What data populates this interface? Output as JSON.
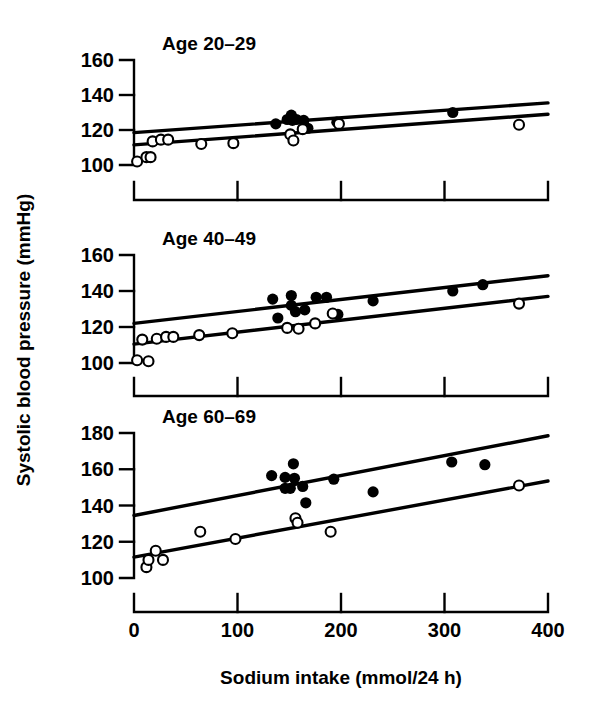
{
  "figure": {
    "xlabel": "Sodium intake (mmol/24 h)",
    "ylabel": "Systolic blood pressure (mmHg)",
    "ink_color": "#000000",
    "background_color": "#ffffff"
  },
  "chart_data": {
    "type": "scatter",
    "title": "",
    "xlabel": "Sodium intake (mmol/24 h)",
    "ylabel": "Systolic blood pressure (mmHg)",
    "xlim": [
      0,
      400
    ],
    "xticks": [
      0,
      100,
      200,
      300,
      400
    ],
    "xticklabels": [
      "0",
      "100",
      "200",
      "300",
      "400"
    ],
    "grid": false,
    "legend_position": "none",
    "series_marker_key": {
      "filled-circle": "men",
      "open-circle": "women"
    },
    "panels": [
      {
        "title": "Age 20–29",
        "ylim": [
          100,
          160
        ],
        "yticks": [
          100,
          120,
          140,
          160
        ],
        "yticklabels": [
          "100",
          "120",
          "140",
          "160"
        ],
        "series": [
          {
            "name": "filled",
            "marker": "filled-circle",
            "points": [
              [
                137,
                123.5
              ],
              [
                148,
                126.0
              ],
              [
                152,
                128.5
              ],
              [
                153,
                125.5
              ],
              [
                157,
                126.0
              ],
              [
                164,
                125.5
              ],
              [
                168,
                121.0
              ],
              [
                196,
                124.5
              ],
              [
                308,
                130.0
              ]
            ],
            "fit_line": {
              "x": [
                0,
                400
              ],
              "y": [
                118.5,
                135.5
              ]
            }
          },
          {
            "name": "open",
            "marker": "open-circle",
            "points": [
              [
                3,
                102.0
              ],
              [
                12,
                104.5
              ],
              [
                16,
                104.5
              ],
              [
                18,
                113.5
              ],
              [
                26,
                114.5
              ],
              [
                33,
                114.5
              ],
              [
                65,
                112.0
              ],
              [
                96,
                112.5
              ],
              [
                151,
                117.5
              ],
              [
                154,
                114.0
              ],
              [
                163,
                120.5
              ],
              [
                198,
                123.5
              ],
              [
                372,
                123.0
              ]
            ],
            "fit_line": {
              "x": [
                0,
                400
              ],
              "y": [
                111.5,
                129.0
              ]
            }
          }
        ]
      },
      {
        "title": "Age 40–49",
        "ylim": [
          100,
          160
        ],
        "yticks": [
          100,
          120,
          140,
          160
        ],
        "yticklabels": [
          "100",
          "120",
          "140",
          "160"
        ],
        "series": [
          {
            "name": "filled",
            "marker": "filled-circle",
            "points": [
              [
                134,
                135.5
              ],
              [
                139,
                125.0
              ],
              [
                152,
                137.5
              ],
              [
                152,
                132.0
              ],
              [
                156,
                128.5
              ],
              [
                165,
                129.5
              ],
              [
                176,
                136.5
              ],
              [
                186,
                136.5
              ],
              [
                197,
                127.0
              ],
              [
                231,
                134.5
              ],
              [
                308,
                140.0
              ],
              [
                337,
                143.5
              ]
            ],
            "fit_line": {
              "x": [
                0,
                400
              ],
              "y": [
                122.0,
                148.5
              ]
            }
          },
          {
            "name": "open",
            "marker": "open-circle",
            "points": [
              [
                3,
                101.5
              ],
              [
                8,
                113.0
              ],
              [
                14,
                101.0
              ],
              [
                22,
                113.5
              ],
              [
                31,
                114.5
              ],
              [
                38,
                114.5
              ],
              [
                63,
                115.5
              ],
              [
                95,
                116.5
              ],
              [
                148,
                119.5
              ],
              [
                159,
                119.0
              ],
              [
                175,
                122.0
              ],
              [
                192,
                127.5
              ],
              [
                372,
                133.0
              ]
            ],
            "fit_line": {
              "x": [
                0,
                400
              ],
              "y": [
                110.5,
                137.0
              ]
            }
          }
        ]
      },
      {
        "title": "Age 60–69",
        "ylim": [
          100,
          180
        ],
        "yticks": [
          100,
          120,
          140,
          160,
          180
        ],
        "yticklabels": [
          "100",
          "120",
          "140",
          "160",
          "180"
        ],
        "series": [
          {
            "name": "filled",
            "marker": "filled-circle",
            "points": [
              [
                133,
                156.5
              ],
              [
                146,
                155.5
              ],
              [
                146,
                149.5
              ],
              [
                151,
                149.5
              ],
              [
                154,
                163.0
              ],
              [
                155,
                155.0
              ],
              [
                163,
                150.5
              ],
              [
                166,
                141.5
              ],
              [
                193,
                154.5
              ],
              [
                231,
                147.5
              ],
              [
                307,
                164.0
              ],
              [
                339,
                162.5
              ]
            ],
            "fit_line": {
              "x": [
                0,
                400
              ],
              "y": [
                134.5,
                178.5
              ]
            }
          },
          {
            "name": "open",
            "marker": "open-circle",
            "points": [
              [
                12,
                106.0
              ],
              [
                14,
                110.0
              ],
              [
                21,
                115.0
              ],
              [
                28,
                110.0
              ],
              [
                64,
                125.5
              ],
              [
                98,
                121.5
              ],
              [
                156,
                133.0
              ],
              [
                158,
                130.5
              ],
              [
                190,
                125.5
              ],
              [
                372,
                151.0
              ]
            ],
            "fit_line": {
              "x": [
                0,
                400
              ],
              "y": [
                111.5,
                153.5
              ]
            }
          }
        ]
      }
    ]
  }
}
